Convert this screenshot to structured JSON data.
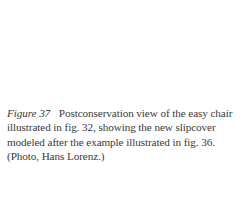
{
  "caption": {
    "label": "Figure 37",
    "text": "Postconservation view of the easy chair illustrated in fig. 32, showing the new slipcover modeled after the example illustrated in fig. 36. (Photo, Hans Lorenz.)"
  }
}
